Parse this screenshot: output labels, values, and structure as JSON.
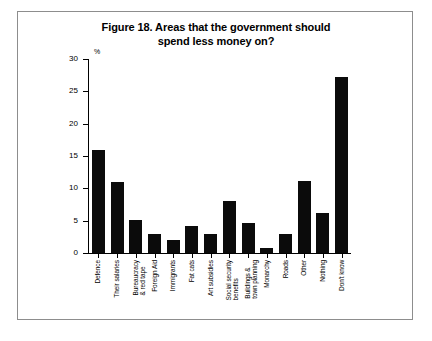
{
  "figure": {
    "title_line1": "Figure 18. Areas that the government should",
    "title_line2": "spend less money on?",
    "border_color": "#8d8d8d",
    "bar_color": "#0b0b0b",
    "background": "#ffffff"
  },
  "axis": {
    "unit_label": "%",
    "y_ticks": [
      "0",
      "5",
      "10",
      "15",
      "20",
      "25",
      "30"
    ]
  },
  "chart_data": {
    "type": "bar",
    "title": "Figure 18. Areas that the government should spend less money on?",
    "xlabel": "",
    "ylabel": "%",
    "ylim": [
      0,
      30
    ],
    "ytick_values": [
      0,
      5,
      10,
      15,
      20,
      25,
      30
    ],
    "grid": false,
    "legend": "none",
    "orientation": "vertical",
    "categories": [
      "Defence",
      "Their salaries",
      "Bureaucracy & red tape",
      "Foreign Aid",
      "Immigrants",
      "Fat cats",
      "Art subsidies",
      "Social security benefits",
      "Buildings & town planning",
      "Monarchy",
      "Roads",
      "Other",
      "Nothing",
      "Don't know"
    ],
    "values": [
      16,
      11,
      5.1,
      3,
      2,
      4.2,
      3,
      8.1,
      4.7,
      0.8,
      3,
      11.2,
      6.2,
      27.2
    ]
  },
  "x_labels": [
    "Defence",
    "Their salaries",
    "Bureaucracy\n& red tape",
    "Foreign Aid",
    "Immigrants",
    "Fat cats",
    "Art subsidies",
    "Social security\nbenefits",
    "Buildings &\ntown planning",
    "Monarchy",
    "Roads",
    "Other",
    "Nothing",
    "Don't know"
  ]
}
